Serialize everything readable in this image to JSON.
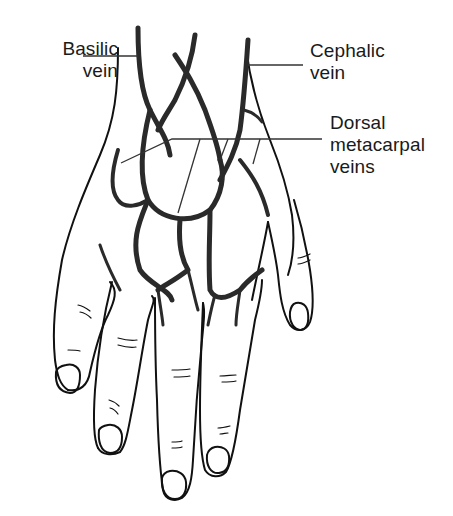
{
  "diagram": {
    "labels": {
      "basilic": {
        "line1": "Basilic",
        "line2": "vein"
      },
      "cephalic": {
        "line1": "Cephalic",
        "line2": "vein"
      },
      "dorsal_metacarpal": {
        "line1": "Dorsal",
        "line2": "metacarpal",
        "line3": "veins"
      }
    },
    "colors": {
      "outline": "#111111",
      "vein": "#2a2a2a",
      "leader_line": "#333333",
      "background": "#ffffff"
    }
  }
}
